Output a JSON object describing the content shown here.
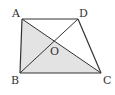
{
  "diagram": {
    "shaded_region": "triangle ABC",
    "colors": {
      "line": "#333333",
      "shade": "#e3e3e3",
      "background": "#ffffff"
    },
    "vertices": {
      "A": {
        "label": "A",
        "x": 22,
        "y": 19
      },
      "D": {
        "label": "D",
        "x": 78,
        "y": 19
      },
      "B": {
        "label": "B",
        "x": 20,
        "y": 73
      },
      "C": {
        "label": "C",
        "x": 101,
        "y": 73
      },
      "O": {
        "label": "O",
        "x": 53,
        "y": 42
      }
    },
    "segments": [
      "AD",
      "AB",
      "BC",
      "CD",
      "AC",
      "BD"
    ]
  }
}
